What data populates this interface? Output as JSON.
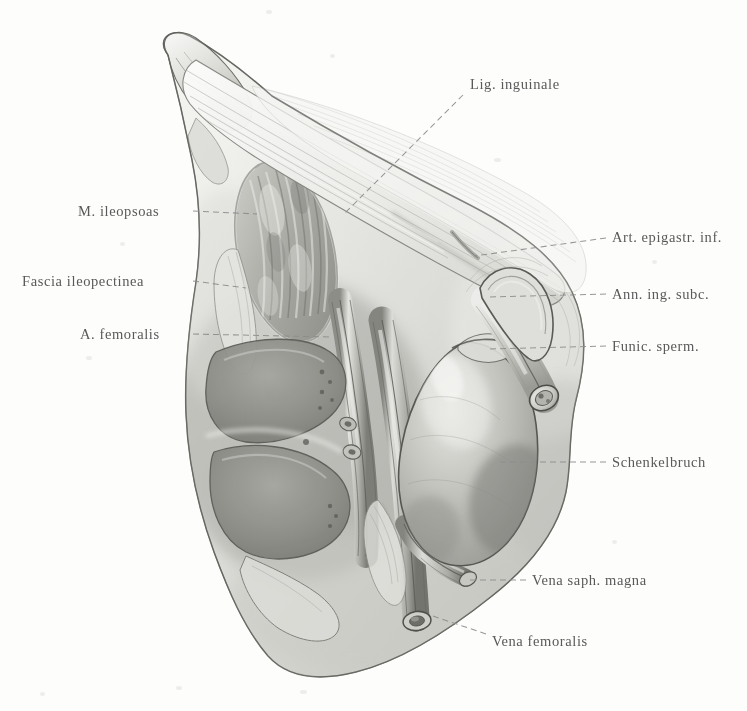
{
  "plate": {
    "title": "Schenkelbruch (femoral hernia) dissection plate",
    "background_color": "#fdfdfc",
    "ink_color": "#4d4d4d",
    "leader_color": "#8c8c8c",
    "width": 747,
    "height": 711
  },
  "labels": [
    {
      "id": "lig-inguinale",
      "text": "Lig. inguinale",
      "side": "top",
      "x": 470,
      "y": 77,
      "leader": "M 463 95 L 345 213"
    },
    {
      "id": "m-ileopsoas",
      "text": "M. ileopsoas",
      "side": "left",
      "x": 78,
      "y": 204,
      "leader": "M 193 211 L 257 214"
    },
    {
      "id": "fascia-ileopectinea",
      "text": "Fascia ileopectinea",
      "side": "left",
      "x": 22,
      "y": 274,
      "leader": "M 193 281 L 246 288"
    },
    {
      "id": "a-femoralis",
      "text": "A. femoralis",
      "side": "left",
      "x": 80,
      "y": 327,
      "leader": "M 193 334 L 330 337"
    },
    {
      "id": "art-epigastr-inf",
      "text": "Art. epigastr. inf.",
      "side": "right",
      "x": 612,
      "y": 230,
      "leader": "M 606 238 L 474 256"
    },
    {
      "id": "ann-ing-subc",
      "text": "Ann. ing. subc.",
      "side": "right",
      "x": 612,
      "y": 287,
      "leader": "M 606 294 L 487 297"
    },
    {
      "id": "funic-sperm",
      "text": "Funic. sperm.",
      "side": "right",
      "x": 612,
      "y": 339,
      "leader": "M 606 346 L 487 349"
    },
    {
      "id": "schenkelbruch",
      "text": "Schenkelbruch",
      "side": "right",
      "x": 612,
      "y": 455,
      "leader": "M 606 462 L 497 462"
    },
    {
      "id": "vena-saph-magna",
      "text": "Vena saph. magna",
      "side": "right",
      "x": 532,
      "y": 573,
      "leader": "M 526 580 L 466 580"
    },
    {
      "id": "vena-femoralis",
      "text": "Vena femoralis",
      "side": "right",
      "x": 492,
      "y": 634,
      "leader": "M 486 634 L 430 615"
    }
  ],
  "figure": {
    "structures": [
      {
        "id": "specimen-body",
        "name": "skin-and-fascia-block"
      },
      {
        "id": "iliac-spine",
        "name": "anterior-superior-iliac-spine"
      },
      {
        "id": "inguinal-ligament",
        "name": "lig-inguinale-band"
      },
      {
        "id": "iliopsoas-muscle",
        "name": "m-ileopsoas-belly"
      },
      {
        "id": "iliopectineal-fascia",
        "name": "fascia-ileopectinea"
      },
      {
        "id": "femoral-artery",
        "name": "a-femoralis-vessel"
      },
      {
        "id": "femoral-vein",
        "name": "vena-femoralis-vessel"
      },
      {
        "id": "saphenous-vein",
        "name": "vena-saph-magna-branch"
      },
      {
        "id": "hernia-sac",
        "name": "schenkelbruch-sac"
      },
      {
        "id": "spermatic-cord",
        "name": "funic-sperm-cord"
      },
      {
        "id": "subcutaneous-ring",
        "name": "ann-ing-subc-ring"
      },
      {
        "id": "epigastric-artery",
        "name": "art-epigastr-inf-vessel"
      }
    ],
    "tones": {
      "paper": "#fdfdfc",
      "highlight": "#f4f4f2",
      "light": "#e2e2de",
      "mid": "#bdbdb8",
      "shade": "#9a9a95",
      "deep": "#7b7b77",
      "dark": "#5e5e5a",
      "outline": "#4a4a46"
    }
  }
}
